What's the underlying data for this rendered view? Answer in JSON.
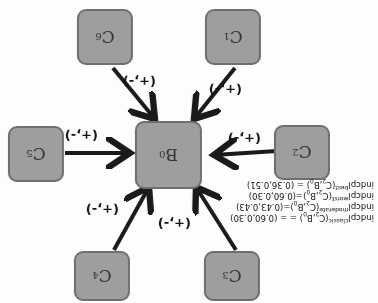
{
  "orientation": "rotated 180 degrees",
  "center_node": {
    "label": "B",
    "sub": "0"
  },
  "nodes": [
    {
      "id": "C1",
      "label": "C",
      "sub": "1"
    },
    {
      "id": "C2",
      "label": "C",
      "sub": "2"
    },
    {
      "id": "C3",
      "label": "C",
      "sub": "3"
    },
    {
      "id": "C4",
      "label": "C",
      "sub": "4"
    },
    {
      "id": "C5",
      "label": "C",
      "sub": "5"
    },
    {
      "id": "C6",
      "label": "C",
      "sub": "6"
    }
  ],
  "edge_labels": [
    "(+,-)",
    "(+,-)",
    "(+,-)",
    "(+,-)",
    "(+,-)",
    "(+,-)"
  ],
  "annotation": [
    {
      "pre": "indcpl",
      "sup": "classic",
      "args": "(C",
      "s1": "2",
      "mid": ",B",
      "s2": "0",
      "post": ") = = (0.60,0.30)"
    },
    {
      "pre": "indcpl",
      "sup": "moderate",
      "args": "(C",
      "s1": "2",
      "mid": ",B",
      "s2": "0",
      "post": ")=(0.43,0.43)"
    },
    {
      "pre": "indcpl",
      "sup": "worst",
      "args": "(C",
      "s1": "2",
      "mid": ",B",
      "s2": "0",
      "post": ")=(0.60,0.30)"
    },
    {
      "pre": "indcpl",
      "sup": "best",
      "args": "(C",
      "s1": "2",
      "mid": ",B",
      "s2": "0",
      "post": ") = (0.36,0.51)"
    }
  ],
  "colors": {
    "node_fill": "#9e9e9e",
    "node_border": "#6f6f6f",
    "arrow": "#1a1a1a"
  }
}
